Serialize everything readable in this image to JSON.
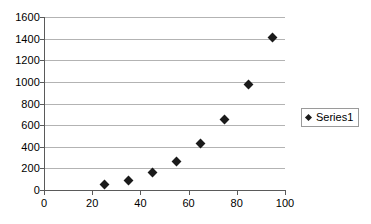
{
  "chart_data": {
    "type": "scatter",
    "title": "",
    "xlabel": "",
    "ylabel": "",
    "xlim": [
      0,
      100
    ],
    "ylim": [
      0,
      1600
    ],
    "grid": "horizontal",
    "legend_position": "right",
    "x_ticks": [
      "0",
      "20",
      "40",
      "60",
      "80",
      "100"
    ],
    "x_tick_values": [
      0,
      20,
      40,
      60,
      80,
      100
    ],
    "y_ticks": [
      "0",
      "200",
      "400",
      "600",
      "800",
      "1000",
      "1200",
      "1400",
      "1600"
    ],
    "y_tick_values": [
      0,
      200,
      400,
      600,
      800,
      1000,
      1200,
      1400,
      1600
    ],
    "series": [
      {
        "name": "Series1",
        "marker": "diamond",
        "color": "#1a1a1a",
        "x": [
          25,
          35,
          45,
          55,
          65,
          75,
          85,
          95
        ],
        "values": [
          50,
          90,
          160,
          265,
          430,
          650,
          975,
          1410
        ],
        "points": [
          [
            25,
            50
          ],
          [
            35,
            90
          ],
          [
            45,
            160
          ],
          [
            55,
            265
          ],
          [
            65,
            430
          ],
          [
            75,
            650
          ],
          [
            85,
            975
          ],
          [
            95,
            1410
          ]
        ]
      }
    ]
  },
  "legend": {
    "entries": [
      {
        "label": "Series1",
        "marker_icon": "diamond-marker-icon"
      }
    ]
  },
  "colors": {
    "background": "#ffffff",
    "gridline": "#b3b3b3",
    "axis": "#5a5a5a",
    "marker": "#1a1a1a",
    "legend_border": "#9a9a9a",
    "text": "#000000"
  }
}
